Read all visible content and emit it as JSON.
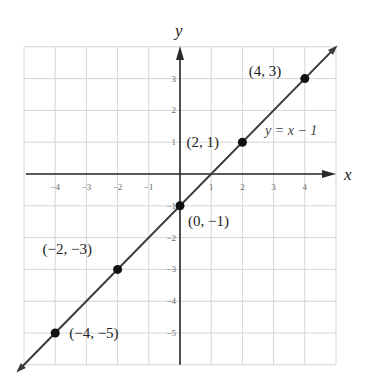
{
  "chart_data": {
    "type": "line",
    "title": "",
    "xlabel": "x",
    "ylabel": "y",
    "xlim": [
      -5,
      5
    ],
    "ylim": [
      -6,
      4
    ],
    "grid": true,
    "x_ticks": [
      -4,
      -3,
      -2,
      -1,
      1,
      2,
      3,
      4
    ],
    "y_ticks": [
      3,
      2,
      1,
      -1,
      -2,
      -3,
      -4,
      -5
    ],
    "series": [
      {
        "name": "y = x − 1",
        "equation": "y = x − 1",
        "slope": 1,
        "intercept": -1,
        "line_color": "#3a3a3a"
      }
    ],
    "points": [
      {
        "x": 4,
        "y": 3,
        "label": "(4, 3)"
      },
      {
        "x": 2,
        "y": 1,
        "label": "(2, 1)"
      },
      {
        "x": 0,
        "y": -1,
        "label": "(0, −1)"
      },
      {
        "x": -2,
        "y": -3,
        "label": "(−2, −3)"
      },
      {
        "x": -4,
        "y": -5,
        "label": "(−4, −5)"
      }
    ],
    "annotations": [
      {
        "text": "y = x − 1",
        "near": [
          3,
          1
        ]
      }
    ]
  },
  "labels": {
    "x_axis": "x",
    "y_axis": "y",
    "equation": "y = x − 1",
    "tick_x": [
      "−4",
      "−3",
      "−2",
      "−1",
      "1",
      "2",
      "3",
      "4"
    ],
    "tick_y": [
      "3",
      "2",
      "1",
      "−1",
      "−2",
      "−3",
      "−4",
      "−5"
    ],
    "points": [
      "(4, 3)",
      "(2, 1)",
      "(0, −1)",
      "(−2, −3)",
      "(−4, −5)"
    ]
  },
  "colors": {
    "grid": "#d6d6d6",
    "axis": "#2a2a2a",
    "line": "#3a3a3a",
    "point": "#111111",
    "tick_text": "#6a6a6a"
  }
}
